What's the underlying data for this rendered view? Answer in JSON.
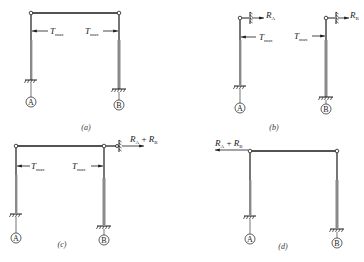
{
  "figure": {
    "panels": [
      {
        "id": "a",
        "caption": "(a)",
        "labels": {
          "t_left": "T",
          "t_left_sub": "max",
          "t_right": "T",
          "t_right_sub": "max"
        },
        "supports": {
          "left": "A",
          "right": "B"
        }
      },
      {
        "id": "b",
        "caption": "(b)",
        "labels": {
          "t_left": "T",
          "t_left_sub": "max",
          "t_right": "T",
          "t_right_sub": "max",
          "r_left": "R",
          "r_left_sub": "A",
          "r_right": "R",
          "r_right_sub": "B"
        },
        "supports": {
          "left": "A",
          "right": "B"
        }
      },
      {
        "id": "c",
        "caption": "(c)",
        "labels": {
          "t_left": "T",
          "t_left_sub": "max",
          "t_right": "T",
          "t_right_sub": "max",
          "r": "R",
          "r_sub1": "A",
          "plus": " + ",
          "r2": "R",
          "r_sub2": "B"
        },
        "supports": {
          "left": "A",
          "right": "B"
        }
      },
      {
        "id": "d",
        "caption": "(d)",
        "labels": {
          "r": "R",
          "r_sub1": "A",
          "plus": " + ",
          "r2": "R",
          "r_sub2": "B"
        },
        "supports": {
          "left": "A",
          "right": "B"
        }
      }
    ],
    "colors": {
      "line": "#1a1a1a",
      "column_fill": "#8a8a8a",
      "background": "#ffffff"
    }
  }
}
